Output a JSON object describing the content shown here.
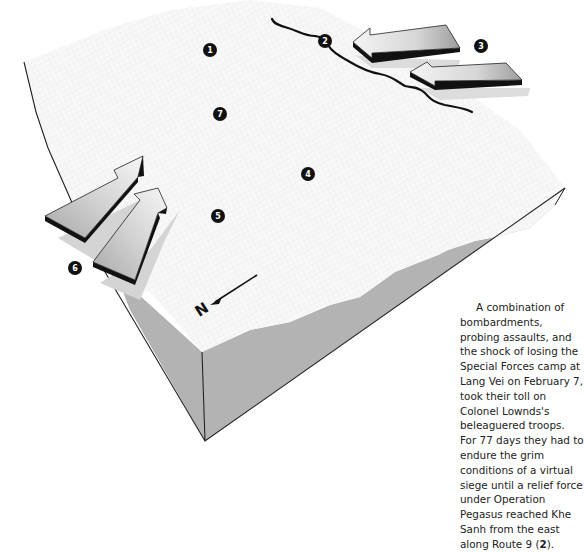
{
  "diagram": {
    "type": "3d-terrain-block",
    "colors": {
      "terrain_surface": "#f7f7f7",
      "terrain_grid": "#e3e3e3",
      "side_face": "#b3b3b3",
      "edge_line": "#222222",
      "road": "#111111",
      "marker_fill": "#111111",
      "marker_text": "#ffffff",
      "arrow_light": "#f2f2f2",
      "arrow_dark": "#9a9a9a",
      "arrow_edge": "#111111",
      "shadow": "#cfcfcf"
    },
    "markers": [
      {
        "id": "1",
        "label": "1",
        "x": 210,
        "y": 50
      },
      {
        "id": "2",
        "label": "2",
        "x": 325,
        "y": 41
      },
      {
        "id": "3",
        "label": "3",
        "x": 481,
        "y": 46
      },
      {
        "id": "4",
        "label": "4",
        "x": 308,
        "y": 174
      },
      {
        "id": "5",
        "label": "5",
        "x": 218,
        "y": 216
      },
      {
        "id": "6",
        "label": "6",
        "x": 75,
        "y": 268
      },
      {
        "id": "7",
        "label": "7",
        "x": 220,
        "y": 114
      }
    ],
    "arrows": [
      {
        "id": "arrow-east-upper",
        "direction": "west",
        "marker": "3"
      },
      {
        "id": "arrow-east-lower",
        "direction": "west",
        "marker": "3"
      },
      {
        "id": "arrow-west-upper",
        "direction": "northeast",
        "marker": "6"
      },
      {
        "id": "arrow-west-lower",
        "direction": "northeast",
        "marker": "6"
      }
    ],
    "road": {
      "name": "Route 9",
      "marker": "2"
    },
    "compass": {
      "label": "N",
      "icon": "north-arrow-icon"
    }
  },
  "caption": {
    "lines": [
      "A combination of",
      "bombardments,",
      "probing assaults, and",
      "the shock of losing the",
      "Special Forces camp at",
      "Lang Vei on February 7,",
      "took their toll on",
      "Colonel Lownds's",
      "beleaguered troops.",
      "For 77 days they had to",
      "endure the grim",
      "conditions of a virtual",
      "siege until a relief force",
      "under Operation",
      "Pegasus reached Khe",
      "Sanh from the east"
    ],
    "last_line_prefix": "along Route 9 (",
    "last_line_bold": "2",
    "last_line_suffix": ")."
  }
}
